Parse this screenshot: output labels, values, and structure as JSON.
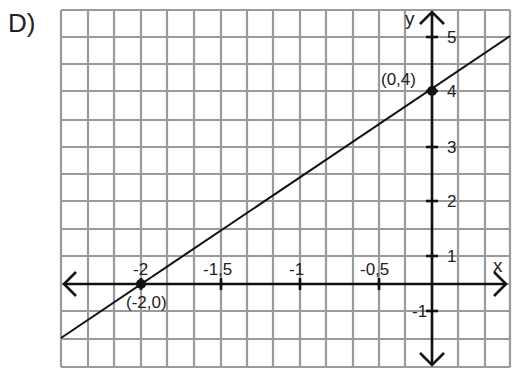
{
  "problem_label": "D)",
  "chart_data": {
    "type": "line",
    "title": "",
    "xlabel": "x",
    "ylabel": "y",
    "grid": true,
    "x_ticks": [
      {
        "value": -2,
        "label": "-2"
      },
      {
        "value": -1.5,
        "label": "-1,5"
      },
      {
        "value": -1,
        "label": "-1"
      },
      {
        "value": -0.5,
        "label": "-0,5"
      }
    ],
    "y_ticks": [
      {
        "value": 5,
        "label": "5"
      },
      {
        "value": 4,
        "label": "4"
      },
      {
        "value": 3,
        "label": "3"
      },
      {
        "value": 2,
        "label": "2"
      },
      {
        "value": 1,
        "label": "1"
      },
      {
        "value": -1,
        "label": "-1"
      }
    ],
    "series": [
      {
        "name": "y = 2x + 4",
        "slope": 2,
        "intercept": 4,
        "points": [
          {
            "x": -2,
            "y": 0,
            "label": "(-2,0)"
          },
          {
            "x": 0,
            "y": 4,
            "label": "(0,4)"
          }
        ]
      }
    ],
    "points": [
      {
        "x": -2,
        "y": 0,
        "label": "(-2,0)"
      },
      {
        "x": 0,
        "y": 4,
        "label": "(0,4)"
      }
    ],
    "xlim": [
      -2.5,
      0.35
    ],
    "ylim": [
      -1.5,
      5.5
    ]
  }
}
